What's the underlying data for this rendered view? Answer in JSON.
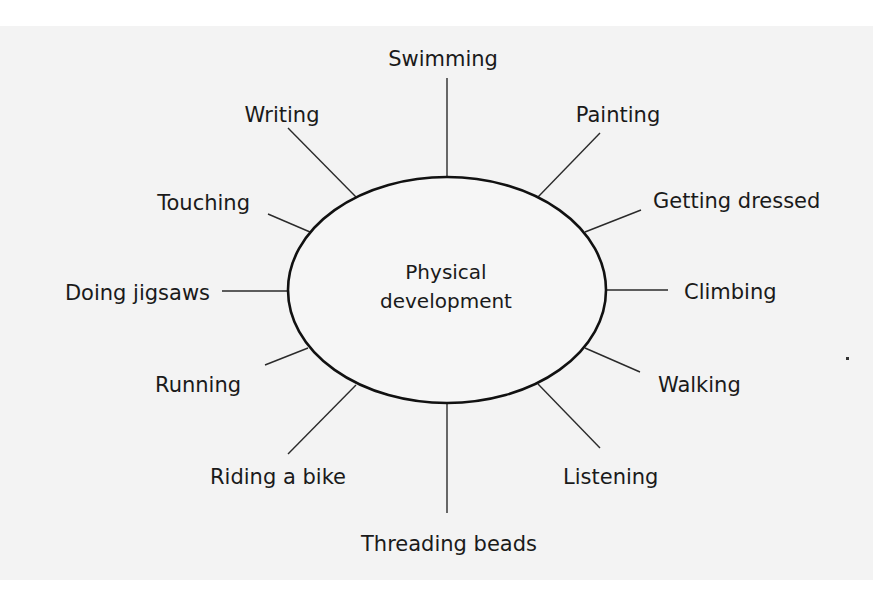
{
  "diagram": {
    "type": "spider-diagram",
    "center": {
      "line1": "Physical",
      "line2": "development"
    },
    "branches": [
      {
        "label": "Swimming"
      },
      {
        "label": "Painting"
      },
      {
        "label": "Getting dressed"
      },
      {
        "label": "Climbing"
      },
      {
        "label": "Walking"
      },
      {
        "label": "Listening"
      },
      {
        "label": "Threading beads"
      },
      {
        "label": "Riding a bike"
      },
      {
        "label": "Running"
      },
      {
        "label": "Doing jigsaws"
      },
      {
        "label": "Touching"
      },
      {
        "label": "Writing"
      }
    ]
  },
  "colors": {
    "background": "#f3f3f3",
    "margin": "#ffffff",
    "ink": "#1a1a1a"
  }
}
